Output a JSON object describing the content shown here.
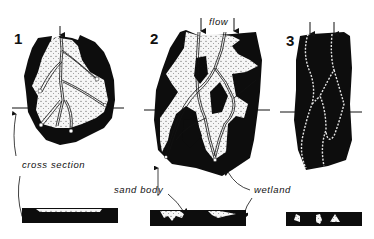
{
  "diagram": {
    "panels": [
      {
        "number": "1",
        "type": "sheet-like sand with distributary channels",
        "cross_section": "continuous thin sand sheet"
      },
      {
        "number": "2",
        "type": "anastomosing sand bodies around wetland islands",
        "cross_section": "lensoid sand bodies"
      },
      {
        "number": "3",
        "type": "narrow channels within wetland",
        "cross_section": "isolated sand pods"
      }
    ],
    "labels": {
      "flow": "flow",
      "cross_section": "cross section",
      "sand_body": "sand body",
      "wetland": "wetland"
    },
    "colors": {
      "wetland": "#0d0d0d",
      "sand": "#f4f4f4",
      "background": "#ffffff"
    }
  }
}
